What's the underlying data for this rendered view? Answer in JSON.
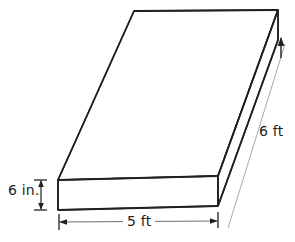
{
  "figure": {
    "type": "rectangular-prism-slab",
    "colors": {
      "outline": "#231f20",
      "fill": "#ffffff",
      "dimension_line": "#6d6e71",
      "background": "#ffffff",
      "text": "#231f20"
    },
    "dimensions": {
      "height": {
        "value": "6 in.",
        "magnitude": 6,
        "unit": "in.",
        "orientation": "vertical",
        "position": "left",
        "name": "thickness"
      },
      "width": {
        "value": "5 ft",
        "magnitude": 5,
        "unit": "ft",
        "orientation": "horizontal",
        "position": "bottom",
        "name": "front-width"
      },
      "depth": {
        "value": "6 ft",
        "magnitude": 6,
        "unit": "ft",
        "orientation": "diagonal",
        "position": "right",
        "name": "depth"
      }
    },
    "geometry": {
      "top_face": "134,11 278,10 218,176 58,180",
      "front_face": "58,180 218,176 218,206 58,210",
      "right_face": "278,10 218,176 218,206 278,40"
    }
  }
}
